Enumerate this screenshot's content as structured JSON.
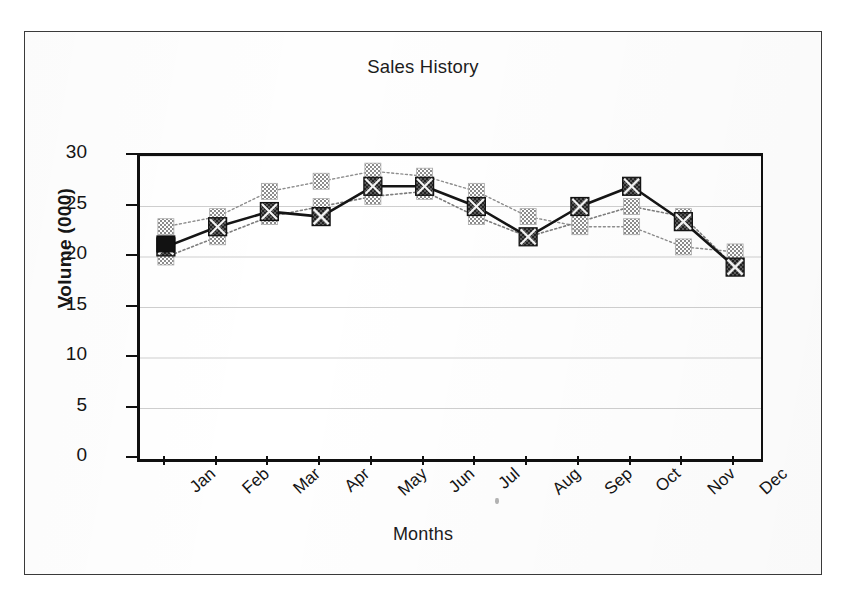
{
  "page": {
    "frame_color": "#3a3a3a",
    "background": "#ffffff"
  },
  "chart_data": {
    "type": "line",
    "title": "Sales History",
    "xlabel": "Months",
    "ylabel": "Volume (000)",
    "categories": [
      "Jan",
      "Feb",
      "Mar",
      "Apr",
      "May",
      "Jun",
      "Jul",
      "Aug",
      "Sep",
      "Oct",
      "Nov",
      "Dec"
    ],
    "ylim": [
      0,
      30
    ],
    "yticks": [
      0,
      5,
      10,
      15,
      20,
      25,
      30
    ],
    "ytick_labels": [
      "0",
      "5",
      "10",
      "15",
      "20",
      "25",
      "30"
    ],
    "grid": true,
    "grid_axis": "y",
    "legend": "none",
    "series": [
      {
        "name": "Series 1",
        "marker": "x-square",
        "color": "#151515",
        "line_style": "solid",
        "line_width": 2.6,
        "values": [
          21,
          23,
          24.5,
          24,
          27,
          27,
          25,
          22,
          25,
          27,
          23.5,
          19
        ]
      },
      {
        "name": "Series 2",
        "marker": "square",
        "color": "#8e8e8e",
        "line_style": "dotted",
        "line_width": 1.4,
        "values": [
          23,
          24,
          26.5,
          27.5,
          28.5,
          28,
          26.5,
          24,
          23,
          23,
          21,
          20.5
        ]
      },
      {
        "name": "Series 3",
        "marker": "square",
        "color": "#7d7d7d",
        "line_style": "dotted",
        "line_width": 1.6,
        "values": [
          20,
          22,
          24,
          25,
          26,
          26.5,
          24,
          22,
          23.5,
          25,
          24,
          19
        ]
      }
    ]
  }
}
